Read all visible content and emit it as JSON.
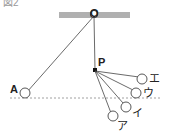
{
  "figure": {
    "header_fragment": "図2",
    "labels": {
      "pivot": "O",
      "nail": "P",
      "start": "A",
      "positions": [
        "ア",
        "イ",
        "ウ",
        "エ"
      ]
    },
    "colors": {
      "ceiling": "#b0b0b0",
      "line": "#444444",
      "dashed": "#888888"
    }
  }
}
